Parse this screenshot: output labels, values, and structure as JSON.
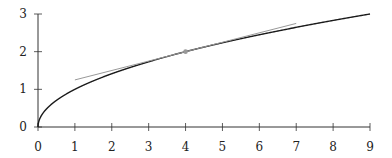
{
  "chart_data": {
    "type": "line",
    "title": "",
    "xlabel": "",
    "ylabel": "",
    "xlim": [
      0,
      9
    ],
    "ylim": [
      0,
      3
    ],
    "grid": false,
    "x_ticks": [
      "0",
      "1",
      "2",
      "3",
      "4",
      "5",
      "6",
      "7",
      "8",
      "9"
    ],
    "y_ticks": [
      "0",
      "1",
      "2",
      "3"
    ],
    "series": [
      {
        "name": "sqrt(x)",
        "function": "y = sqrt(x)",
        "x_range": [
          0,
          9
        ],
        "color": "#1a1a1a",
        "x": [
          0,
          0.25,
          0.5,
          1,
          2,
          3,
          4,
          5,
          6,
          7,
          8,
          9
        ],
        "y": [
          0,
          0.5,
          0.71,
          1,
          1.41,
          1.73,
          2,
          2.24,
          2.45,
          2.65,
          2.83,
          3
        ]
      },
      {
        "name": "tangent at x=4",
        "function": "y = 2 + (x - 4)/4",
        "color": "#999999",
        "x": [
          1,
          7
        ],
        "y": [
          1.25,
          2.75
        ]
      }
    ],
    "points": [
      {
        "x": 4,
        "y": 2,
        "color": "#999999"
      }
    ]
  },
  "layout": {
    "x0_px": 38,
    "x9_px": 370,
    "y0_px": 127,
    "y3_px": 14
  }
}
